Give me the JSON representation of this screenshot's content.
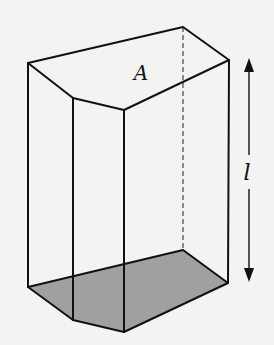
{
  "figure": {
    "labels": {
      "area": "A",
      "length": "l"
    },
    "colors": {
      "background": "#f3f3f1",
      "edges": "#111111",
      "base_fill": "#a0a0a0",
      "hidden_edge": "#555555"
    }
  }
}
